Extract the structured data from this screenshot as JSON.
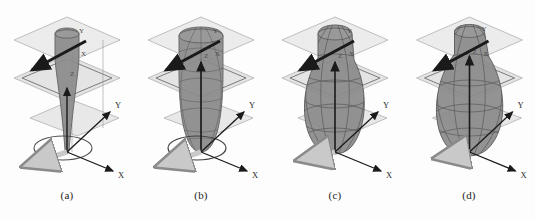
{
  "figure": {
    "background_color": "#fdfdfd",
    "panel_count": 4,
    "panels": [
      {
        "id": "a",
        "caption": "(a)",
        "body_style": "narrow-cone",
        "body_fill": "#8c8c8c",
        "body_stroke": "#5a5a5a",
        "body_width_scale": 0.42,
        "mesh_visible": false,
        "base_ellipse_visible": true,
        "axes": {
          "z": "Z",
          "x_main": "X",
          "y_main": "Y",
          "x_plane": "X",
          "y_plane": "Y"
        }
      },
      {
        "id": "b",
        "caption": "(b)",
        "body_style": "medium-capsule",
        "body_fill": "#8c8c8c",
        "body_stroke": "#5a5a5a",
        "body_width_scale": 0.72,
        "mesh_visible": true,
        "base_ellipse_visible": true,
        "axes": {
          "z": "Z",
          "x_main": "X",
          "y_main": "Y",
          "x_plane": "X",
          "y_plane": "Y"
        }
      },
      {
        "id": "c",
        "caption": "(c)",
        "body_style": "wide-teardrop",
        "body_fill": "#8c8c8c",
        "body_stroke": "#5a5a5a",
        "body_width_scale": 0.92,
        "mesh_visible": true,
        "base_ellipse_visible": false,
        "axes": {
          "z": "Z",
          "x_main": "X",
          "y_main": "Y",
          "x_plane": "X",
          "y_plane": "Y"
        }
      },
      {
        "id": "d",
        "caption": "(d)",
        "body_style": "widest-teardrop",
        "body_fill": "#8c8c8c",
        "body_stroke": "#5a5a5a",
        "body_width_scale": 1.0,
        "mesh_visible": true,
        "base_ellipse_visible": false,
        "axes": {
          "z": "Z",
          "x_main": "X",
          "y_main": "Y",
          "x_plane": "X",
          "y_plane": "Y"
        }
      }
    ],
    "colors": {
      "plane_fill_top": "#ececec",
      "plane_fill_mid": "#e4e4e4",
      "plane_fill_bottom": "#e8e8e8",
      "plane_stroke": "#b0b0b0",
      "plane_stroke_dark": "#6f6f6f",
      "body_fill": "#8c8c8c",
      "body_stroke": "#5a5a5a",
      "mesh_stroke": "#555555",
      "axis_arrow": "#1a1a1a",
      "light_arrow_fill": "#c9c9c9",
      "light_arrow_stroke": "#8a8a8a",
      "text": "#1b1b1b"
    }
  }
}
